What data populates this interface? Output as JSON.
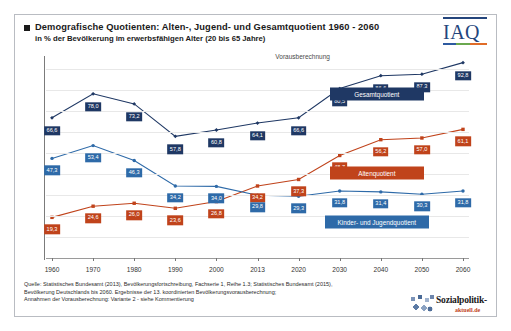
{
  "header": {
    "bullet": "square-bullet",
    "title": "Demografische Quotienten:  Alten-, Jugend- und Gesamtquotient  1960 - 2060",
    "subtitle": "in % der Bevölkerung im erwerbsfähigen Alter (20 bis 65 Jahre)"
  },
  "logo": {
    "iaq": "IAQ"
  },
  "annotation": {
    "forecast": "Vorausberechnung"
  },
  "footer": {
    "line1": "Quelle: Statistisches Bundesamt (2013), Bevölkerungsfortschreibung,  Fachserie 1, Reihe 1.3; Statistisches Bundesamt (2015),",
    "line2": "Bevölkerung Deutschlands bis 2060. Ergebnisse der 13. koordinierten Bevölkerungsvorausberechnung;",
    "line3": "Annahmen der Vorausberechnung:  Variante 2 - siehe Kommentierung"
  },
  "watermark": {
    "word1": "Sozialpolitik-",
    "word2": "aktuell.de",
    "icon": "people-crowd-icon"
  },
  "colors": {
    "gesamt": "#1f3864",
    "alten": "#c0431b",
    "jugend": "#2e6aa8",
    "grid": "#e8e8e8",
    "axis": "#7b7b7b"
  },
  "chart_data": {
    "type": "line",
    "title": "Demografische Quotienten:  Alten-, Jugend- und Gesamtquotient  1960 - 2060",
    "subtitle": "in % der Bevölkerung im erwerbsfähigen Alter (20 bis 65 Jahre)",
    "xlabel": "",
    "ylabel": "",
    "categories": [
      "1960",
      "1970",
      "1980",
      "1990",
      "2000",
      "2013",
      "2020",
      "2030",
      "2040",
      "2050",
      "2060"
    ],
    "ylim": [
      0,
      95
    ],
    "yticks": [
      0,
      10,
      20,
      30,
      40,
      50,
      60,
      70,
      80,
      90
    ],
    "grid": true,
    "legend": "inline-labels",
    "annotations": [
      {
        "text": "Vorausberechnung",
        "x": "2013-2020",
        "note": "marks start of projection period"
      }
    ],
    "series": [
      {
        "name": "Gesamtquotient",
        "color": "#1f3864",
        "values": [
          66.6,
          78.0,
          73.2,
          57.8,
          60.8,
          64.1,
          66.6,
          80.5,
          86.6,
          87.3,
          92.8
        ]
      },
      {
        "name": "Altenquotient",
        "color": "#c0431b",
        "values": [
          19.3,
          24.6,
          26.0,
          23.6,
          26.8,
          34.2,
          37.3,
          48.7,
          56.2,
          57.0,
          61.1
        ]
      },
      {
        "name": "Kinder- und Jugendquotient",
        "color": "#2e6aa8",
        "values": [
          47.3,
          53.4,
          46.3,
          34.2,
          34.0,
          29.8,
          29.3,
          31.8,
          31.4,
          30.3,
          31.8
        ]
      }
    ]
  }
}
